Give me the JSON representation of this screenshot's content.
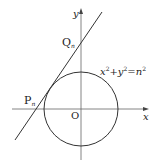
{
  "diagram": {
    "axes": {
      "x_label": "x",
      "y_label": "y",
      "origin_label": "O"
    },
    "circle": {
      "equation_lhs_x": "x",
      "equation_sup1": "2",
      "equation_plus": "+",
      "equation_lhs_y": "y",
      "equation_sup2": "2",
      "equation_eq": "=",
      "equation_rhs": "n",
      "equation_sup3": "2",
      "equation_text": "x²+y²=n²"
    },
    "points": {
      "Q": {
        "label": "Q",
        "subscript": "n"
      },
      "P": {
        "label": "P",
        "subscript": "n"
      }
    },
    "colors": {
      "stroke": "#333333",
      "axis": "#555555",
      "background": "#ffffff"
    }
  }
}
